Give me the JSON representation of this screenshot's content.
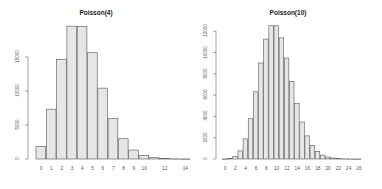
{
  "chart_data": [
    {
      "type": "bar",
      "title": "Poisson(4)",
      "xlabel": "",
      "ylabel": "",
      "categories": [
        0,
        1,
        2,
        3,
        4,
        5,
        6,
        7,
        8,
        9,
        10,
        11,
        12,
        13,
        14
      ],
      "values": [
        1830,
        7330,
        14650,
        19540,
        19500,
        15630,
        10420,
        5950,
        2980,
        1320,
        530,
        190,
        64,
        20,
        6
      ],
      "xticks": [
        "0",
        "1",
        "2",
        "3",
        "4",
        "5",
        "6",
        "7",
        "8",
        "9",
        "10",
        "12",
        "14"
      ],
      "xtick_values": [
        0,
        1,
        2,
        3,
        4,
        5,
        6,
        7,
        8,
        9,
        10,
        12,
        14
      ],
      "yticks": [
        "0",
        "5000",
        "10000",
        "15000"
      ],
      "ytick_values": [
        0,
        5000,
        10000,
        15000
      ],
      "ylim": [
        0,
        20000
      ],
      "grid": false,
      "bar_fill": "#e6e6e6",
      "bar_stroke": "#555555"
    },
    {
      "type": "bar",
      "title": "Poisson(10)",
      "xlabel": "",
      "ylabel": "",
      "categories": [
        0,
        1,
        2,
        3,
        4,
        5,
        6,
        7,
        8,
        9,
        10,
        11,
        12,
        13,
        14,
        15,
        16,
        17,
        18,
        19,
        20,
        21,
        22,
        23,
        24,
        25,
        26
      ],
      "values": [
        5,
        45,
        230,
        760,
        1890,
        3780,
        6310,
        9010,
        11260,
        12510,
        12510,
        11370,
        9480,
        7290,
        5210,
        3470,
        2170,
        1280,
        710,
        370,
        190,
        90,
        40,
        17,
        7,
        3,
        1
      ],
      "xticks": [
        "0",
        "2",
        "4",
        "6",
        "8",
        "10",
        "12",
        "14",
        "16",
        "18",
        "20",
        "22",
        "24",
        "26"
      ],
      "xtick_values": [
        0,
        2,
        4,
        6,
        8,
        10,
        12,
        14,
        16,
        18,
        20,
        22,
        24,
        26
      ],
      "yticks": [
        "0",
        "2000",
        "4000",
        "6000",
        "8000",
        "10000",
        "12000"
      ],
      "ytick_values": [
        0,
        2000,
        4000,
        6000,
        8000,
        10000,
        12000
      ],
      "ylim": [
        0,
        12800
      ],
      "grid": false,
      "bar_fill": "#e6e6e6",
      "bar_stroke": "#555555"
    }
  ],
  "panels": [
    {
      "title": "Poisson(4)"
    },
    {
      "title": "Poisson(10)"
    }
  ]
}
